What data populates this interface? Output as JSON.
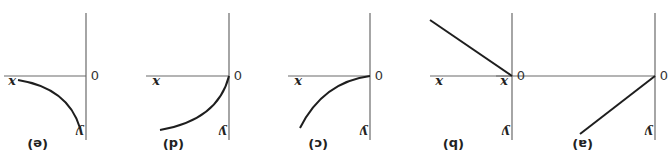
{
  "figure": {
    "orientation": "rotated-180",
    "panels": [
      {
        "id": "a",
        "caption": "(a)",
        "x_label": "x",
        "y_label": "y",
        "origin_label": "0",
        "shape": "linear-increasing"
      },
      {
        "id": "b",
        "caption": "(b)",
        "x_label": "x",
        "y_label": "y",
        "origin_label": "0",
        "shape": "linear-decreasing"
      },
      {
        "id": "c",
        "caption": "(c)",
        "x_label": "x",
        "y_label": "y",
        "origin_label": "0",
        "shape": "concave-curve-through-origin"
      },
      {
        "id": "d",
        "caption": "(d)",
        "x_label": "x",
        "y_label": "y",
        "origin_label": "0",
        "shape": "convex-curve-through-origin"
      },
      {
        "id": "e",
        "caption": "(e)",
        "x_label": "x",
        "y_label": "y",
        "origin_label": "0",
        "shape": "curve-offset-from-origin"
      }
    ]
  }
}
